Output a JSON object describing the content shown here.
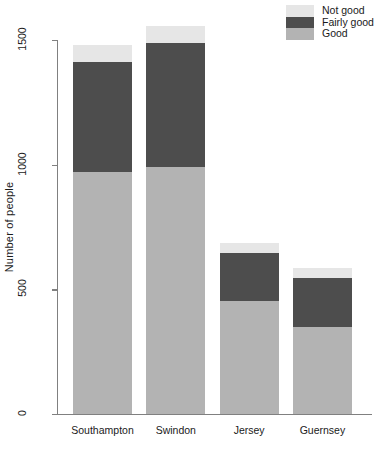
{
  "chart_data": {
    "type": "bar",
    "subtype": "stacked-bar",
    "title": "",
    "xlabel": "",
    "ylabel": "Number of people",
    "categories": [
      "Southampton",
      "Swindon",
      "Jersey",
      "Guernsey"
    ],
    "series": [
      {
        "name": "Good",
        "color": "#b3b3b3",
        "values": [
          970,
          990,
          455,
          350
        ]
      },
      {
        "name": "Fairly good",
        "color": "#4d4d4d",
        "values": [
          440,
          500,
          190,
          195
        ]
      },
      {
        "name": "Not good",
        "color": "#e6e6e6",
        "values": [
          70,
          65,
          40,
          40
        ]
      }
    ],
    "totals": [
      1480,
      1555,
      685,
      585
    ],
    "ylim": [
      0,
      1570
    ],
    "yticks": [
      0,
      500,
      1000,
      1500
    ],
    "ytick_labels": [
      "0",
      "500",
      "1000",
      "1500"
    ],
    "grid": false,
    "legend_position": "top-right",
    "legend_entries": [
      "Not good",
      "Fairly good",
      "Good"
    ],
    "legend_colors": [
      "#e6e6e6",
      "#4d4d4d",
      "#b3b3b3"
    ],
    "background_color": "#ffffff",
    "axis_color": "#808080"
  }
}
